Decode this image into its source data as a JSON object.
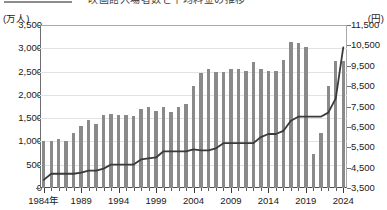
{
  "title": {
    "text": "映画館入場者数と平均料金の推移",
    "rule_color": "#8d8d8d"
  },
  "axes": {
    "left_unit": "(万人)",
    "right_unit": "(円)",
    "left_ticks": [
      "0",
      "500",
      "1,000",
      "1,500",
      "2,000",
      "2,500",
      "3,000",
      "3,500"
    ],
    "right_ticks": [
      "3,500",
      "4,500",
      "5,500",
      "6,500",
      "7,500",
      "8,500",
      "9,500",
      "10,500",
      "11,500"
    ],
    "x_labels": [
      "1984年",
      "1989",
      "1994",
      "1999",
      "2004",
      "2009",
      "2014",
      "2019",
      "2024"
    ],
    "x_label_years": [
      1984,
      1989,
      1994,
      1999,
      2004,
      2009,
      2014,
      2019,
      2024
    ]
  },
  "colors": {
    "bar": "#8a8a8a",
    "line": "#3a3a3a",
    "grid": "#e2e2e2",
    "frame": "#4a4a4a",
    "text": "#1a1a1a"
  },
  "chart_data": {
    "type": "bar",
    "title": "映画館入場者数と平均料金の推移",
    "subtitle": "",
    "xlabel": "",
    "ylabel": "入場者数（万人）",
    "y2label": "平均料金（円）",
    "ylim": [
      0,
      3500
    ],
    "y2lim": [
      3500,
      11500
    ],
    "grid": true,
    "legend_position": "none",
    "x": [
      1984,
      1985,
      1986,
      1987,
      1988,
      1989,
      1990,
      1991,
      1992,
      1993,
      1994,
      1995,
      1996,
      1997,
      1998,
      1999,
      2000,
      2001,
      2002,
      2003,
      2004,
      2005,
      2006,
      2007,
      2008,
      2009,
      2010,
      2011,
      2012,
      2013,
      2014,
      2015,
      2016,
      2017,
      2018,
      2019,
      2020,
      2021,
      2022,
      2023,
      2024
    ],
    "categories": [
      "1984",
      "1985",
      "1986",
      "1987",
      "1988",
      "1989",
      "1990",
      "1991",
      "1992",
      "1993",
      "1994",
      "1995",
      "1996",
      "1997",
      "1998",
      "1999",
      "2000",
      "2001",
      "2002",
      "2003",
      "2004",
      "2005",
      "2006",
      "2007",
      "2008",
      "2009",
      "2010",
      "2011",
      "2012",
      "2013",
      "2014",
      "2015",
      "2016",
      "2017",
      "2018",
      "2019",
      "2020",
      "2021",
      "2022",
      "2023",
      "2024"
    ],
    "series": [
      {
        "name": "入場者数",
        "type": "bar",
        "unit": "万人",
        "axis": "left",
        "values": [
          1000,
          1000,
          1050,
          1020,
          1190,
          1330,
          1460,
          1380,
          1570,
          1580,
          1570,
          1570,
          1550,
          1700,
          1730,
          1650,
          1750,
          1640,
          1730,
          1800,
          2200,
          2480,
          2550,
          2500,
          2500,
          2560,
          2550,
          2520,
          2700,
          2560,
          2520,
          2520,
          2740,
          3130,
          3120,
          3020,
          3000,
          3000,
          3240,
          2880,
          2730
        ]
      },
      {
        "name": "平均料金",
        "type": "line",
        "unit": "円",
        "axis": "right",
        "values": [
          3900,
          4200,
          4200,
          4200,
          4200,
          4250,
          4350,
          4350,
          4450,
          4650,
          4650,
          4650,
          4650,
          4900,
          4950,
          5000,
          5300,
          5300,
          5300,
          5300,
          5400,
          5350,
          5350,
          5450,
          5700,
          5700,
          5700,
          5700,
          5700,
          6000,
          6150,
          6150,
          6300,
          6800,
          7000,
          7000,
          7000,
          7000,
          7200,
          7900,
          10400
        ]
      }
    ],
    "bar_values_raw": [
      1000,
      1000,
      1050,
      1020,
      1190,
      1330,
      1460,
      1380,
      1570,
      1580,
      1570,
      1570,
      1550,
      1700,
      1730,
      1650,
      1750,
      1640,
      1730,
      1800,
      2200,
      2480,
      2550,
      2500,
      2500,
      2560,
      2550,
      2520,
      2700,
      2560,
      2520,
      2520,
      2740,
      3130,
      3120,
      3020,
      3000,
      3000,
      3240,
      2880,
      2730
    ],
    "line_values_raw": [
      3900,
      4200,
      4200,
      4200,
      4200,
      4250,
      4350,
      4350,
      4450,
      4650,
      4650,
      4650,
      4650,
      4900,
      4950,
      5000,
      5300,
      5300,
      5300,
      5300,
      5400,
      5350,
      5350,
      5450,
      5700,
      5700,
      5700,
      5700,
      5700,
      6000,
      6150,
      6150,
      6300,
      6800,
      7000,
      7000,
      7000,
      7000,
      7200,
      7900,
      10400
    ],
    "bar_overrides": {
      "2020": 740,
      "2021": 1190,
      "2022": 2190,
      "2023": 2730
    }
  }
}
